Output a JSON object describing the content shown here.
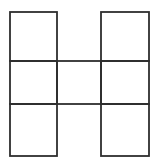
{
  "canvas": {
    "width": 158,
    "height": 166,
    "background": "#ffffff"
  },
  "figure": {
    "grid": {
      "cols": 3,
      "rows": 3
    },
    "cells": [
      {
        "col": 0,
        "row": 0
      },
      {
        "col": 2,
        "row": 0
      },
      {
        "col": 0,
        "row": 1
      },
      {
        "col": 1,
        "row": 1
      },
      {
        "col": 2,
        "row": 1
      },
      {
        "col": 0,
        "row": 2
      },
      {
        "col": 2,
        "row": 2
      }
    ],
    "geometry": {
      "x_lines": [
        10,
        57,
        101,
        149
      ],
      "y_lines": [
        12,
        61,
        104,
        156
      ]
    },
    "style": {
      "stroke_color": "#2e2e2e",
      "stroke_width": 1.8,
      "fill": "none"
    }
  }
}
